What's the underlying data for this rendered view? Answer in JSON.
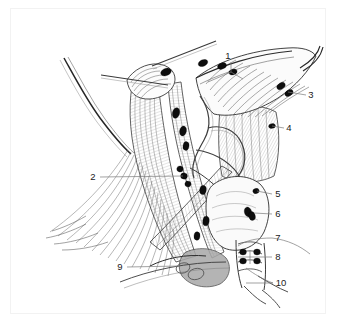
{
  "figure": {
    "type": "anatomical-line-illustration",
    "background_color": "#ffffff",
    "ink_color": "#1b1b1b",
    "node_fill_color": "#0d0d0d",
    "leader_color": "#7a7a7a",
    "border_color": "#f2f2f2"
  },
  "labels": [
    {
      "id": "1",
      "text": "1",
      "x": 230,
      "y": 56,
      "side": "top",
      "leader": "branched"
    },
    {
      "id": "2",
      "text": "2",
      "x": 93,
      "y": 177,
      "side": "left",
      "leader": "horizontal"
    },
    {
      "id": "3",
      "text": "3",
      "x": 311,
      "y": 95,
      "side": "right",
      "leader": "horizontal"
    },
    {
      "id": "4",
      "text": "4",
      "x": 289,
      "y": 128,
      "side": "right",
      "leader": "horizontal"
    },
    {
      "id": "5",
      "text": "5",
      "x": 278,
      "y": 194,
      "side": "right",
      "leader": "horizontal"
    },
    {
      "id": "6",
      "text": "6",
      "x": 278,
      "y": 214,
      "side": "right",
      "leader": "horizontal"
    },
    {
      "id": "7",
      "text": "7",
      "x": 278,
      "y": 238,
      "side": "right",
      "leader": "curved"
    },
    {
      "id": "8",
      "text": "8",
      "x": 278,
      "y": 257,
      "side": "right",
      "leader": "bracket"
    },
    {
      "id": "9",
      "text": "9",
      "x": 120,
      "y": 267,
      "side": "left",
      "leader": "horizontal"
    },
    {
      "id": "10",
      "text": "10",
      "x": 279,
      "y": 283,
      "side": "right",
      "leader": "horizontal"
    }
  ],
  "nodes": [
    {
      "x": 166,
      "y": 72
    },
    {
      "x": 203,
      "y": 63
    },
    {
      "x": 222,
      "y": 66
    },
    {
      "x": 232,
      "y": 72
    },
    {
      "x": 281,
      "y": 86
    },
    {
      "x": 288,
      "y": 93
    },
    {
      "x": 272,
      "y": 126
    },
    {
      "x": 176,
      "y": 113
    },
    {
      "x": 183,
      "y": 131
    },
    {
      "x": 186,
      "y": 146
    },
    {
      "x": 180,
      "y": 169
    },
    {
      "x": 183,
      "y": 176
    },
    {
      "x": 187,
      "y": 183
    },
    {
      "x": 203,
      "y": 190
    },
    {
      "x": 206,
      "y": 221
    },
    {
      "x": 196,
      "y": 236
    },
    {
      "x": 256,
      "y": 191
    },
    {
      "x": 248,
      "y": 211
    },
    {
      "x": 247,
      "y": 215
    },
    {
      "x": 243,
      "y": 252
    },
    {
      "x": 256,
      "y": 252
    },
    {
      "x": 243,
      "y": 260
    },
    {
      "x": 256,
      "y": 260
    }
  ]
}
